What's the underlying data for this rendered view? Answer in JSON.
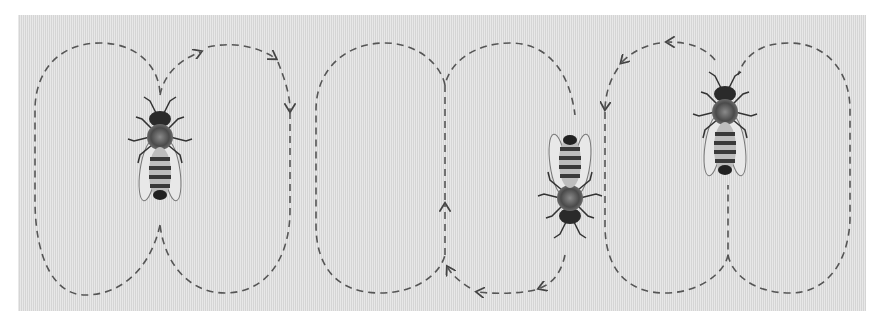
{
  "figure": {
    "background_color": "#dcdcdc",
    "path_color": "#555555",
    "panels": [
      {
        "id": "left",
        "bee_direction": "up",
        "loops": 2
      },
      {
        "id": "middle",
        "bee_direction": "down",
        "loops": 2
      },
      {
        "id": "right",
        "bee_direction": "up",
        "loops": 2
      }
    ]
  }
}
